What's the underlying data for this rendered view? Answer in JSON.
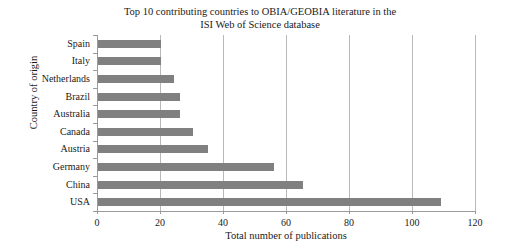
{
  "chart_data": {
    "type": "bar",
    "orientation": "horizontal",
    "title": "Top 10 contributing countries to OBIA/GEOBIA literature in the\nISI Web of Science database",
    "xlabel": "Total number of publications",
    "ylabel": "Country of origin",
    "categories": [
      "Spain",
      "Italy",
      "Netherlands",
      "Brazil",
      "Australia",
      "Canada",
      "Austria",
      "Germany",
      "China",
      "USA"
    ],
    "values": [
      20,
      20,
      24,
      26,
      26,
      30,
      35,
      56,
      65,
      109
    ],
    "xlim": [
      0,
      120
    ],
    "xticks": [
      0,
      20,
      40,
      60,
      80,
      100,
      120
    ],
    "xtick_labels": [
      "0",
      "20",
      "40",
      "60",
      "80",
      "100",
      "120"
    ],
    "grid": "vertical",
    "legend": "none",
    "bar_color": "#808080",
    "gridline_color": "#b9b9b9",
    "axis_color": "#9a9a9a",
    "background": "#ffffff"
  }
}
